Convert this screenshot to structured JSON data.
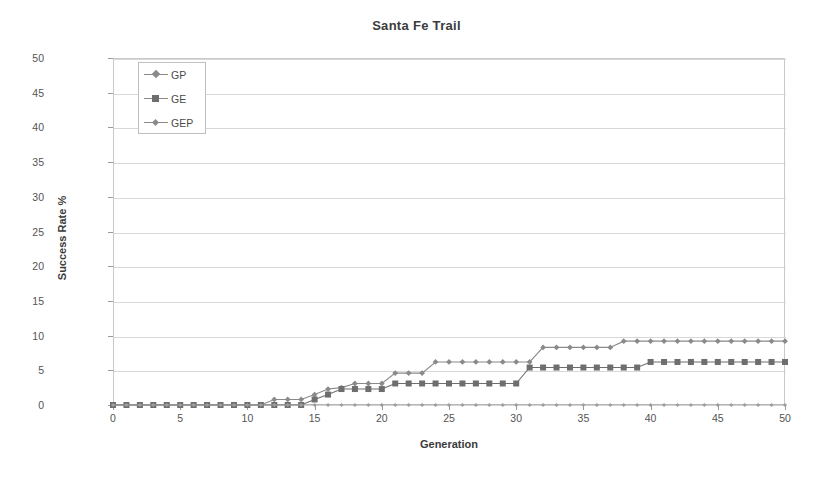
{
  "chart_data": {
    "type": "line",
    "title": "Santa Fe Trail",
    "xlabel": "Generation",
    "ylabel": "Success Rate %",
    "xlim": [
      0,
      50
    ],
    "ylim": [
      0,
      50
    ],
    "xticks": [
      0,
      5,
      10,
      15,
      20,
      25,
      30,
      35,
      40,
      45,
      50
    ],
    "yticks": [
      0,
      5,
      10,
      15,
      20,
      25,
      30,
      35,
      40,
      45,
      50
    ],
    "grid": "horizontal",
    "legend_position": "top-left-inside",
    "x": [
      0,
      1,
      2,
      3,
      4,
      5,
      6,
      7,
      8,
      9,
      10,
      11,
      12,
      13,
      14,
      15,
      16,
      17,
      18,
      19,
      20,
      21,
      22,
      23,
      24,
      25,
      26,
      27,
      28,
      29,
      30,
      31,
      32,
      33,
      34,
      35,
      36,
      37,
      38,
      39,
      40,
      41,
      42,
      43,
      44,
      45,
      46,
      47,
      48,
      49,
      50
    ],
    "series": [
      {
        "name": "GP",
        "color": "#8a8a8a",
        "marker": "diamond",
        "values": [
          0,
          0,
          0,
          0,
          0,
          0,
          0,
          0,
          0,
          0,
          0,
          0,
          0.8,
          0.8,
          0.8,
          1.5,
          2.3,
          2.5,
          3.1,
          3.1,
          3.1,
          4.6,
          4.6,
          4.6,
          6.2,
          6.2,
          6.2,
          6.2,
          6.2,
          6.2,
          6.2,
          6.2,
          8.3,
          8.3,
          8.3,
          8.3,
          8.3,
          8.3,
          9.2,
          9.2,
          9.2,
          9.2,
          9.2,
          9.2,
          9.2,
          9.2,
          9.2,
          9.2,
          9.2,
          9.2,
          9.2
        ]
      },
      {
        "name": "GE",
        "color": "#6e6e6e",
        "marker": "square",
        "values": [
          0,
          0,
          0,
          0,
          0,
          0,
          0,
          0,
          0,
          0,
          0,
          0,
          0,
          0,
          0,
          0.8,
          1.5,
          2.3,
          2.3,
          2.3,
          2.3,
          3.1,
          3.1,
          3.1,
          3.1,
          3.1,
          3.1,
          3.1,
          3.1,
          3.1,
          3.1,
          5.4,
          5.4,
          5.4,
          5.4,
          5.4,
          5.4,
          5.4,
          5.4,
          5.4,
          6.2,
          6.2,
          6.2,
          6.2,
          6.2,
          6.2,
          6.2,
          6.2,
          6.2,
          6.2,
          6.2
        ]
      },
      {
        "name": "GEP",
        "color": "#9e9e9e",
        "marker": "tiny-diamond",
        "values": [
          0,
          0,
          0,
          0,
          0,
          0,
          0,
          0,
          0,
          0,
          0,
          0,
          0,
          0,
          0,
          0,
          0,
          0,
          0,
          0,
          0,
          0,
          0,
          0,
          0,
          0,
          0,
          0,
          0,
          0,
          0,
          0,
          0,
          0,
          0,
          0,
          0,
          0,
          0,
          0,
          0,
          0,
          0,
          0,
          0,
          0,
          0,
          0,
          0,
          0,
          0
        ]
      }
    ]
  },
  "legend": {
    "items": [
      {
        "label": "GP",
        "marker": "diamond"
      },
      {
        "label": "GE",
        "marker": "square"
      },
      {
        "label": "GEP",
        "marker": "tiny-diamond"
      }
    ]
  },
  "colors": {
    "gridline": "#d8d8d8",
    "frame": "#c9c9c9",
    "tick_text": "#545454",
    "title_text": "#3b3b3b"
  }
}
